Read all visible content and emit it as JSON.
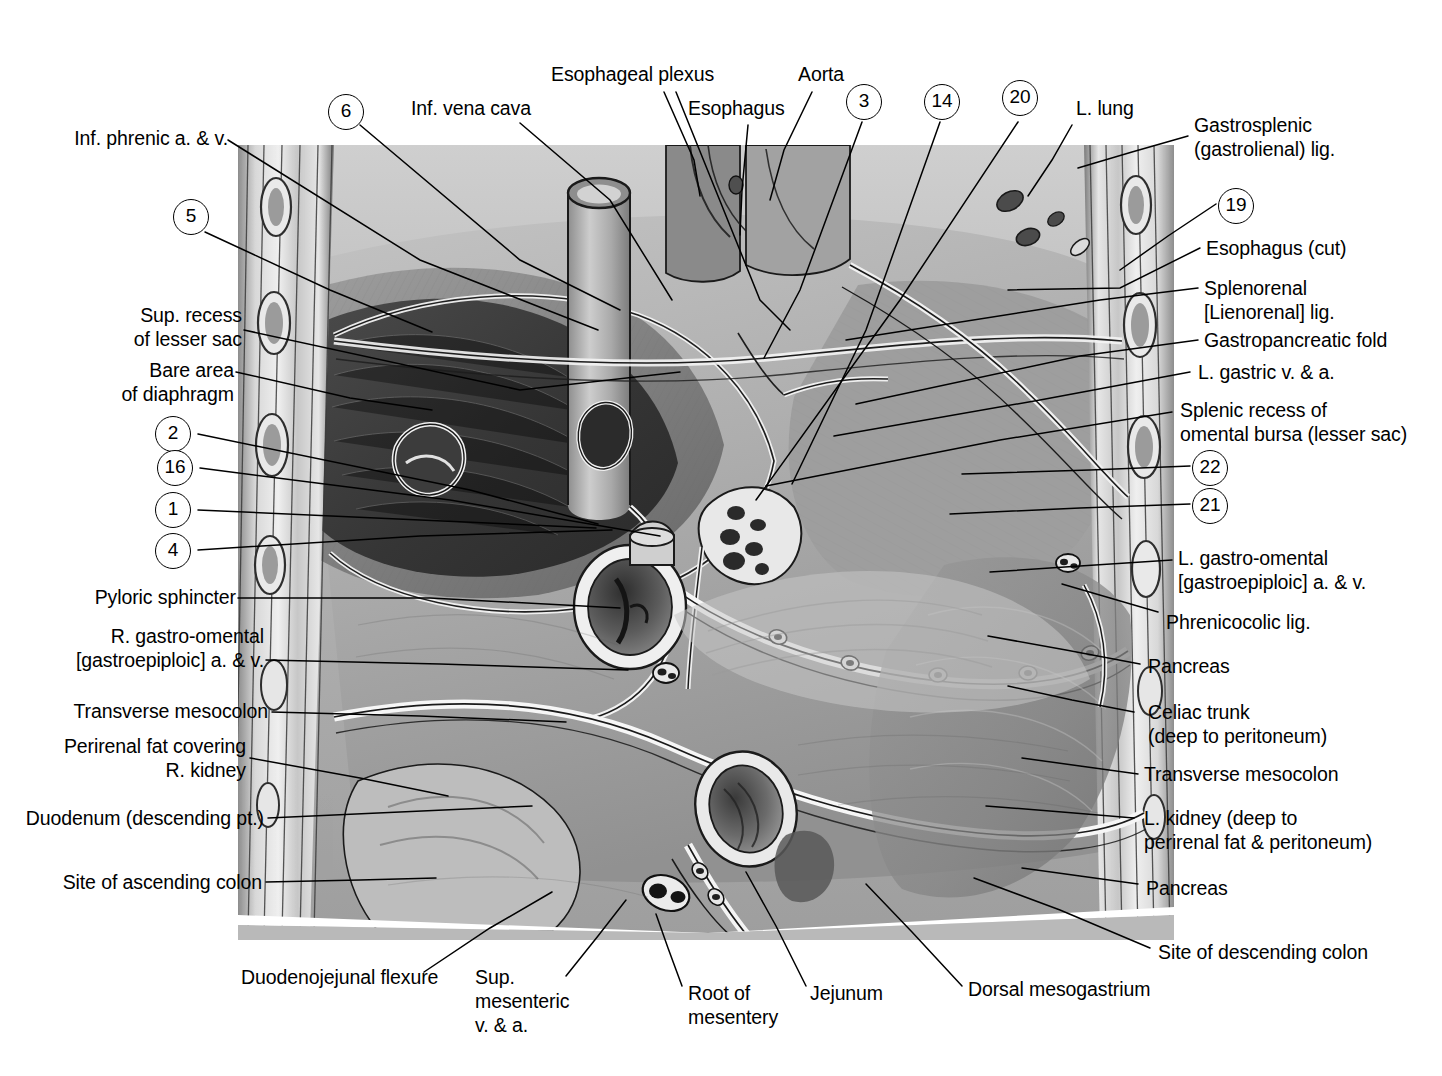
{
  "figure": {
    "type": "anatomical-illustration",
    "style": "grayscale halftone medical atlas plate"
  },
  "colors": {
    "ink": "#000000",
    "page": "#ffffff",
    "plate_light": "#d5d5d5",
    "plate_mid": "#a8a8a8",
    "plate_dark": "#6b6b6b",
    "plate_darkest": "#2f2f2f"
  },
  "labels": {
    "top": [
      {
        "id": "esophageal-plexus",
        "text": "Esophageal plexus"
      },
      {
        "id": "aorta",
        "text": "Aorta"
      },
      {
        "id": "esophagus",
        "text": "Esophagus"
      },
      {
        "id": "inf-vena-cava",
        "text": "Inf. vena cava"
      },
      {
        "id": "l-lung",
        "text": "L. lung"
      }
    ],
    "left": [
      {
        "id": "inf-phrenic",
        "lines": [
          "Inf. phrenic a. & v."
        ]
      },
      {
        "id": "sup-recess-lesser-sac",
        "lines": [
          "Sup. recess",
          "of lesser sac"
        ]
      },
      {
        "id": "bare-area-diaphragm",
        "lines": [
          "Bare area",
          "of diaphragm"
        ]
      },
      {
        "id": "pyloric-sphincter",
        "lines": [
          "Pyloric sphincter"
        ]
      },
      {
        "id": "r-gastro-omental",
        "lines": [
          "R. gastro-omental",
          "[gastroepiploic] a. & v."
        ]
      },
      {
        "id": "transverse-mesocolon-left",
        "lines": [
          "Transverse mesocolon"
        ]
      },
      {
        "id": "perirenal-fat-r-kidney",
        "lines": [
          "Perirenal fat covering",
          "R. kidney"
        ]
      },
      {
        "id": "duodenum-descending",
        "lines": [
          "Duodenum (descending pt.)"
        ]
      },
      {
        "id": "site-ascending-colon",
        "lines": [
          "Site of ascending colon"
        ]
      }
    ],
    "right": [
      {
        "id": "gastrosplenic-lig",
        "lines": [
          "Gastrosplenic",
          "(gastrolienal) lig."
        ]
      },
      {
        "id": "esophagus-cut",
        "lines": [
          "Esophagus (cut)"
        ]
      },
      {
        "id": "splenorenal-lig",
        "lines": [
          "Splenorenal",
          "[Lienorenal] lig."
        ]
      },
      {
        "id": "gastropancreatic-fold",
        "lines": [
          "Gastropancreatic fold"
        ]
      },
      {
        "id": "l-gastric-v-a",
        "lines": [
          "L. gastric v. & a."
        ]
      },
      {
        "id": "splenic-recess-omental-bursa",
        "lines": [
          "Splenic recess of",
          "omental bursa (lesser sac)"
        ]
      },
      {
        "id": "l-gastro-omental",
        "lines": [
          "L. gastro-omental",
          "[gastroepiploic] a. & v."
        ]
      },
      {
        "id": "phrenicocolic-lig",
        "lines": [
          "Phrenicocolic lig."
        ]
      },
      {
        "id": "pancreas-upper",
        "lines": [
          "Pancreas"
        ]
      },
      {
        "id": "celiac-trunk",
        "lines": [
          "Celiac trunk",
          "(deep to peritoneum)"
        ]
      },
      {
        "id": "transverse-mesocolon-right",
        "lines": [
          "Transverse mesocolon"
        ]
      },
      {
        "id": "l-kidney",
        "lines": [
          "L. kidney (deep to",
          "perirenal fat & peritoneum)"
        ]
      },
      {
        "id": "pancreas-lower",
        "lines": [
          "Pancreas"
        ]
      },
      {
        "id": "site-descending-colon",
        "lines": [
          "Site of descending colon"
        ]
      }
    ],
    "bottom": [
      {
        "id": "duodenojejunal-flexure",
        "lines": [
          "Duodenojejunal flexure"
        ]
      },
      {
        "id": "sup-mesenteric",
        "lines": [
          "Sup.",
          "mesenteric",
          "v. & a."
        ]
      },
      {
        "id": "root-of-mesentery",
        "lines": [
          "Root of",
          "mesentery"
        ]
      },
      {
        "id": "jejunum",
        "lines": [
          "Jejunum"
        ]
      },
      {
        "id": "dorsal-mesogastrium",
        "lines": [
          "Dorsal mesogastrium"
        ]
      }
    ]
  },
  "numbers": {
    "left": [
      "6",
      "5",
      "2",
      "16",
      "1",
      "4"
    ],
    "top": [
      "3",
      "14",
      "20"
    ],
    "right": [
      "19",
      "22",
      "21"
    ],
    "all": [
      "1",
      "2",
      "3",
      "4",
      "5",
      "6",
      "14",
      "16",
      "19",
      "20",
      "21",
      "22"
    ]
  },
  "number_markers": [
    {
      "id": "marker-6",
      "value": "6"
    },
    {
      "id": "marker-5",
      "value": "5"
    },
    {
      "id": "marker-2",
      "value": "2"
    },
    {
      "id": "marker-16",
      "value": "16"
    },
    {
      "id": "marker-1",
      "value": "1"
    },
    {
      "id": "marker-4",
      "value": "4"
    },
    {
      "id": "marker-3",
      "value": "3"
    },
    {
      "id": "marker-14",
      "value": "14"
    },
    {
      "id": "marker-20",
      "value": "20"
    },
    {
      "id": "marker-19",
      "value": "19"
    },
    {
      "id": "marker-22",
      "value": "22"
    },
    {
      "id": "marker-21",
      "value": "21"
    }
  ]
}
